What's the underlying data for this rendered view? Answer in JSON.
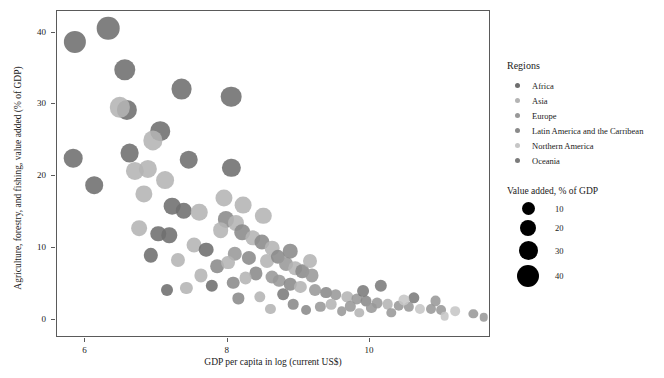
{
  "chart_data": {
    "type": "scatter",
    "title": "",
    "xlabel": "GDP per capita in log (current US$)",
    "ylabel": "Agriculture, forestry, and fishing, value added (% of GDP)",
    "xlim": [
      5.6,
      11.7
    ],
    "ylim": [
      -2.5,
      43.0
    ],
    "xticks": [
      6,
      8,
      10
    ],
    "xticklabels": [
      "6",
      "8",
      "10"
    ],
    "yticks": [
      0,
      10,
      20,
      30,
      40
    ],
    "yticklabels": [
      "0",
      "10",
      "20",
      "30",
      "40"
    ],
    "grid": false,
    "size_encodes": "Value added, % of GDP",
    "color_encodes": "Regions",
    "legend_position": "right",
    "region_colors": {
      "Africa": "#6e6e6e",
      "Asia": "#b4b4b4",
      "Europe": "#989898",
      "Latin America and the Carribean": "#8a8a8a",
      "Northern America": "#c6c6c6",
      "Oceania": "#7b7b7b"
    },
    "size_legend": {
      "title": "Value added, % of GDP",
      "values": [
        10,
        20,
        30,
        40
      ],
      "labels": [
        "10",
        "20",
        "30",
        "40"
      ],
      "diameters_px": [
        13,
        16,
        19,
        22
      ]
    },
    "points": [
      {
        "x": 5.85,
        "y": 38.7,
        "r": 38.7,
        "region": "Africa"
      },
      {
        "x": 6.32,
        "y": 40.6,
        "r": 40.6,
        "region": "Africa"
      },
      {
        "x": 6.55,
        "y": 34.8,
        "r": 34.8,
        "region": "Africa"
      },
      {
        "x": 7.35,
        "y": 32.1,
        "r": 32.1,
        "region": "Africa"
      },
      {
        "x": 8.05,
        "y": 31.1,
        "r": 31.1,
        "region": "Africa"
      },
      {
        "x": 6.58,
        "y": 29.2,
        "r": 29.2,
        "region": "Africa"
      },
      {
        "x": 6.48,
        "y": 29.6,
        "r": 29.6,
        "region": "Asia"
      },
      {
        "x": 7.05,
        "y": 26.3,
        "r": 26.3,
        "region": "Africa"
      },
      {
        "x": 6.95,
        "y": 25.0,
        "r": 25.0,
        "region": "Asia"
      },
      {
        "x": 5.83,
        "y": 22.5,
        "r": 22.5,
        "region": "Africa"
      },
      {
        "x": 6.62,
        "y": 23.2,
        "r": 23.2,
        "region": "Africa"
      },
      {
        "x": 7.45,
        "y": 22.3,
        "r": 22.3,
        "region": "Africa"
      },
      {
        "x": 8.05,
        "y": 21.2,
        "r": 21.2,
        "region": "Africa"
      },
      {
        "x": 6.7,
        "y": 20.8,
        "r": 20.8,
        "region": "Asia"
      },
      {
        "x": 6.12,
        "y": 18.8,
        "r": 18.8,
        "region": "Africa"
      },
      {
        "x": 6.82,
        "y": 17.5,
        "r": 17.5,
        "region": "Asia"
      },
      {
        "x": 7.22,
        "y": 15.8,
        "r": 15.8,
        "region": "Africa"
      },
      {
        "x": 7.38,
        "y": 15.2,
        "r": 15.2,
        "region": "Africa"
      },
      {
        "x": 7.6,
        "y": 15.0,
        "r": 15.0,
        "region": "Asia"
      },
      {
        "x": 7.98,
        "y": 14.0,
        "r": 14.0,
        "region": "Latin America and the Carribean"
      },
      {
        "x": 8.12,
        "y": 13.5,
        "r": 13.5,
        "region": "Asia"
      },
      {
        "x": 7.18,
        "y": 11.8,
        "r": 11.8,
        "region": "Africa"
      },
      {
        "x": 7.02,
        "y": 12.0,
        "r": 12.0,
        "region": "Africa"
      },
      {
        "x": 7.52,
        "y": 10.5,
        "r": 10.5,
        "region": "Asia"
      },
      {
        "x": 7.7,
        "y": 9.8,
        "r": 9.8,
        "region": "Africa"
      },
      {
        "x": 6.92,
        "y": 9.0,
        "r": 9.0,
        "region": "Africa"
      },
      {
        "x": 7.9,
        "y": 12.5,
        "r": 12.5,
        "region": "Asia"
      },
      {
        "x": 8.2,
        "y": 12.2,
        "r": 12.2,
        "region": "Latin America and the Carribean"
      },
      {
        "x": 8.35,
        "y": 11.4,
        "r": 11.4,
        "region": "Asia"
      },
      {
        "x": 8.48,
        "y": 10.8,
        "r": 10.8,
        "region": "Latin America and the Carribean"
      },
      {
        "x": 8.62,
        "y": 10.0,
        "r": 10.0,
        "region": "Asia"
      },
      {
        "x": 8.1,
        "y": 9.2,
        "r": 9.2,
        "region": "Europe"
      },
      {
        "x": 8.3,
        "y": 8.6,
        "r": 8.6,
        "region": "Latin America and the Carribean"
      },
      {
        "x": 8.55,
        "y": 8.2,
        "r": 8.2,
        "region": "Asia"
      },
      {
        "x": 8.7,
        "y": 8.8,
        "r": 8.8,
        "region": "Latin America and the Carribean"
      },
      {
        "x": 8.82,
        "y": 7.8,
        "r": 7.8,
        "region": "Europe"
      },
      {
        "x": 8.95,
        "y": 7.2,
        "r": 7.2,
        "region": "Asia"
      },
      {
        "x": 9.05,
        "y": 6.8,
        "r": 6.8,
        "region": "Latin America and the Carribean"
      },
      {
        "x": 9.18,
        "y": 6.2,
        "r": 6.2,
        "region": "Europe"
      },
      {
        "x": 8.4,
        "y": 6.5,
        "r": 6.5,
        "region": "Latin America and the Carribean"
      },
      {
        "x": 8.25,
        "y": 5.8,
        "r": 5.8,
        "region": "Asia"
      },
      {
        "x": 8.08,
        "y": 5.2,
        "r": 5.2,
        "region": "Latin America and the Carribean"
      },
      {
        "x": 7.78,
        "y": 4.8,
        "r": 4.8,
        "region": "Africa"
      },
      {
        "x": 7.42,
        "y": 4.5,
        "r": 4.5,
        "region": "Asia"
      },
      {
        "x": 7.15,
        "y": 4.2,
        "r": 4.2,
        "region": "Africa"
      },
      {
        "x": 8.72,
        "y": 5.5,
        "r": 5.5,
        "region": "Europe"
      },
      {
        "x": 8.88,
        "y": 5.0,
        "r": 5.0,
        "region": "Latin America and the Carribean"
      },
      {
        "x": 9.02,
        "y": 4.6,
        "r": 4.6,
        "region": "Asia"
      },
      {
        "x": 9.22,
        "y": 4.2,
        "r": 4.2,
        "region": "Europe"
      },
      {
        "x": 9.38,
        "y": 3.8,
        "r": 3.8,
        "region": "Latin America and the Carribean"
      },
      {
        "x": 9.52,
        "y": 3.5,
        "r": 3.5,
        "region": "Europe"
      },
      {
        "x": 9.68,
        "y": 3.2,
        "r": 3.2,
        "region": "Asia"
      },
      {
        "x": 9.82,
        "y": 2.9,
        "r": 2.9,
        "region": "Europe"
      },
      {
        "x": 9.95,
        "y": 2.6,
        "r": 2.6,
        "region": "Latin America and the Carribean"
      },
      {
        "x": 10.1,
        "y": 2.4,
        "r": 2.4,
        "region": "Europe"
      },
      {
        "x": 10.25,
        "y": 2.2,
        "r": 2.2,
        "region": "Asia"
      },
      {
        "x": 10.4,
        "y": 2.0,
        "r": 2.0,
        "region": "Europe"
      },
      {
        "x": 10.55,
        "y": 1.8,
        "r": 1.8,
        "region": "Europe"
      },
      {
        "x": 10.7,
        "y": 1.6,
        "r": 1.6,
        "region": "Northern America"
      },
      {
        "x": 10.85,
        "y": 1.5,
        "r": 1.5,
        "region": "Europe"
      },
      {
        "x": 11.0,
        "y": 1.4,
        "r": 1.4,
        "region": "Europe"
      },
      {
        "x": 11.2,
        "y": 1.2,
        "r": 1.2,
        "region": "Northern America"
      },
      {
        "x": 11.45,
        "y": 0.9,
        "r": 0.9,
        "region": "Europe"
      },
      {
        "x": 10.15,
        "y": 4.8,
        "r": 4.8,
        "region": "Oceania"
      },
      {
        "x": 9.6,
        "y": 1.2,
        "r": 1.2,
        "region": "Europe"
      },
      {
        "x": 9.1,
        "y": 1.4,
        "r": 1.4,
        "region": "Latin America and the Carribean"
      },
      {
        "x": 8.6,
        "y": 1.6,
        "r": 1.6,
        "region": "Asia"
      },
      {
        "x": 9.85,
        "y": 1.0,
        "r": 1.0,
        "region": "Asia"
      },
      {
        "x": 10.3,
        "y": 1.0,
        "r": 1.0,
        "region": "Europe"
      },
      {
        "x": 10.62,
        "y": 3.1,
        "r": 3.1,
        "region": "Oceania"
      },
      {
        "x": 10.48,
        "y": 2.8,
        "r": 2.8,
        "region": "Northern America"
      },
      {
        "x": 8.92,
        "y": 2.2,
        "r": 2.2,
        "region": "Latin America and the Carribean"
      },
      {
        "x": 9.3,
        "y": 1.8,
        "r": 1.8,
        "region": "Europe"
      },
      {
        "x": 8.45,
        "y": 3.2,
        "r": 3.2,
        "region": "Asia"
      },
      {
        "x": 8.15,
        "y": 3.0,
        "r": 3.0,
        "region": "Latin America and the Carribean"
      },
      {
        "x": 7.62,
        "y": 6.2,
        "r": 6.2,
        "region": "Asia"
      },
      {
        "x": 7.85,
        "y": 7.5,
        "r": 7.5,
        "region": "Latin America and the Carribean"
      },
      {
        "x": 8.0,
        "y": 8.0,
        "r": 8.0,
        "region": "Asia"
      },
      {
        "x": 8.62,
        "y": 6.0,
        "r": 6.0,
        "region": "Europe"
      },
      {
        "x": 9.45,
        "y": 2.2,
        "r": 2.2,
        "region": "Asia"
      },
      {
        "x": 9.72,
        "y": 1.9,
        "r": 1.9,
        "region": "Europe"
      },
      {
        "x": 10.02,
        "y": 1.7,
        "r": 1.7,
        "region": "Europe"
      },
      {
        "x": 11.6,
        "y": 0.4,
        "r": 0.4,
        "region": "Europe"
      },
      {
        "x": 11.05,
        "y": 0.5,
        "r": 0.5,
        "region": "Northern America"
      },
      {
        "x": 6.75,
        "y": 12.8,
        "r": 12.8,
        "region": "Asia"
      },
      {
        "x": 7.3,
        "y": 8.4,
        "r": 8.4,
        "region": "Asia"
      },
      {
        "x": 8.78,
        "y": 3.6,
        "r": 3.6,
        "region": "Oceania"
      },
      {
        "x": 9.9,
        "y": 4.0,
        "r": 4.0,
        "region": "Oceania"
      },
      {
        "x": 10.92,
        "y": 2.6,
        "r": 2.6,
        "region": "Europe"
      },
      {
        "x": 8.5,
        "y": 14.5,
        "r": 14.5,
        "region": "Asia"
      },
      {
        "x": 8.88,
        "y": 9.6,
        "r": 9.6,
        "region": "Latin America and the Carribean"
      },
      {
        "x": 9.15,
        "y": 8.2,
        "r": 8.2,
        "region": "Asia"
      },
      {
        "x": 7.12,
        "y": 19.5,
        "r": 19.5,
        "region": "Asia"
      },
      {
        "x": 6.88,
        "y": 21.0,
        "r": 21.0,
        "region": "Asia"
      },
      {
        "x": 8.22,
        "y": 16.0,
        "r": 16.0,
        "region": "Asia"
      },
      {
        "x": 7.95,
        "y": 17.0,
        "r": 17.0,
        "region": "Asia"
      }
    ]
  },
  "axes": {
    "x_title": "GDP per capita in log (current US$)",
    "y_title": "Agriculture, forestry, and fishing, value added (% of GDP)"
  },
  "legend_regions": {
    "title": "Regions",
    "items": [
      {
        "label": "Africa",
        "color": "#6e6e6e"
      },
      {
        "label": "Asia",
        "color": "#b4b4b4"
      },
      {
        "label": "Europe",
        "color": "#989898"
      },
      {
        "label": "Latin America and the Carribean",
        "color": "#8a8a8a"
      },
      {
        "label": "Northern America",
        "color": "#c6c6c6"
      },
      {
        "label": "Oceania",
        "color": "#7b7b7b"
      }
    ]
  },
  "legend_sizes": {
    "title": "Value added, % of GDP",
    "items": [
      {
        "label": "10",
        "diameter": 13
      },
      {
        "label": "20",
        "diameter": 16
      },
      {
        "label": "30",
        "diameter": 19
      },
      {
        "label": "40",
        "diameter": 22
      }
    ]
  }
}
